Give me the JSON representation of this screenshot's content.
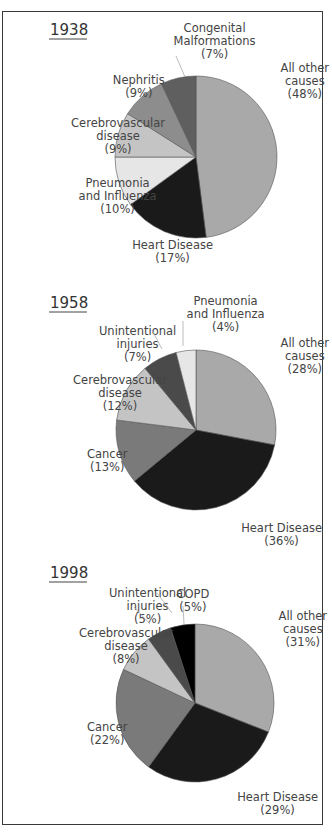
{
  "chart_data": [
    {
      "type": "pie",
      "title": "1938",
      "center": [
        196,
        157
      ],
      "radius": 81,
      "slices": [
        {
          "label": "All other causes",
          "value": 48,
          "color": "#a9a9a9"
        },
        {
          "label": "Heart Disease",
          "value": 17,
          "color": "#1a1a1a"
        },
        {
          "label": "Pneumonia and Influenza",
          "value": 10,
          "color": "#e6e6e6"
        },
        {
          "label": "Cerebrovascular disease",
          "value": 9,
          "color": "#c4c4c4"
        },
        {
          "label": "Nephritis",
          "value": 9,
          "color": "#8d8d8d"
        },
        {
          "label": "Congenital Malformations",
          "value": 7,
          "color": "#5f5f5f"
        }
      ],
      "labels": [
        {
          "lines": [
            "All other",
            "causes",
            "(48%)"
          ],
          "x": 276,
          "y": 72
        },
        {
          "lines": [
            "Heart Disease",
            "(17%)"
          ],
          "x": 131,
          "y": 249
        },
        {
          "lines": [
            "Pneumonia",
            "and Influenza",
            "(10%)"
          ],
          "x": 76,
          "y": 187
        },
        {
          "lines": [
            "Cerebrovascular",
            "disease",
            "(9%)"
          ],
          "x": 70,
          "y": 127
        },
        {
          "lines": [
            "Nephritis",
            "(9%)"
          ],
          "x": 110,
          "y": 84
        },
        {
          "lines": [
            "Congenital",
            "Malformations",
            "(7%)"
          ],
          "x": 173,
          "y": 32
        }
      ]
    },
    {
      "type": "pie",
      "title": "1958",
      "center": [
        196,
        430
      ],
      "radius": 80,
      "slices": [
        {
          "label": "All other causes",
          "value": 28,
          "color": "#a9a9a9"
        },
        {
          "label": "Heart Disease",
          "value": 36,
          "color": "#1a1a1a"
        },
        {
          "label": "Cancer",
          "value": 13,
          "color": "#7a7a7a"
        },
        {
          "label": "Cerebrovascular disease",
          "value": 12,
          "color": "#c4c4c4"
        },
        {
          "label": "Unintentional injuries",
          "value": 7,
          "color": "#4a4a4a"
        },
        {
          "label": "Pneumonia and Influenza",
          "value": 4,
          "color": "#e6e6e6"
        }
      ],
      "labels": [
        {
          "lines": [
            "All other",
            "causes",
            "(28%)"
          ],
          "x": 276,
          "y": 347
        },
        {
          "lines": [
            "Heart Disease",
            "(36%)"
          ],
          "x": 240,
          "y": 532
        },
        {
          "lines": [
            "Cancer",
            "(13%)"
          ],
          "x": 88,
          "y": 458
        },
        {
          "lines": [
            "Cerebrovascular",
            "disease",
            "(12%)"
          ],
          "x": 72,
          "y": 384
        },
        {
          "lines": [
            "Unintentional",
            "injuries",
            "(7%)"
          ],
          "x": 96,
          "y": 335
        },
        {
          "lines": [
            "Pneumonia",
            "and Influenza",
            "(4%)"
          ],
          "x": 184,
          "y": 305
        }
      ]
    },
    {
      "type": "pie",
      "title": "1998",
      "center": [
        195,
        703
      ],
      "radius": 79,
      "slices": [
        {
          "label": "All other causes",
          "value": 31,
          "color": "#a9a9a9"
        },
        {
          "label": "Heart Disease",
          "value": 29,
          "color": "#1a1a1a"
        },
        {
          "label": "Cancer",
          "value": 22,
          "color": "#7a7a7a"
        },
        {
          "label": "Cerebrovascular disease",
          "value": 8,
          "color": "#c4c4c4"
        },
        {
          "label": "Unintentional injuries",
          "value": 5,
          "color": "#4a4a4a"
        },
        {
          "label": "COPD",
          "value": 5,
          "color": "#000000"
        }
      ],
      "labels": [
        {
          "lines": [
            "All other",
            "causes",
            "(31%)"
          ],
          "x": 274,
          "y": 620
        },
        {
          "lines": [
            "Heart Disease",
            "(29%)"
          ],
          "x": 236,
          "y": 801
        },
        {
          "lines": [
            "Cancer",
            "(22%)"
          ],
          "x": 88,
          "y": 731
        },
        {
          "lines": [
            "Cerebrovascular",
            "disease",
            "(8%)"
          ],
          "x": 78,
          "y": 637
        },
        {
          "lines": [
            "Unintentional",
            "injuries",
            "(5%)"
          ],
          "x": 106,
          "y": 597
        },
        {
          "lines": [
            "COPD",
            "(5%)"
          ],
          "x": 180,
          "y": 598
        }
      ]
    }
  ]
}
